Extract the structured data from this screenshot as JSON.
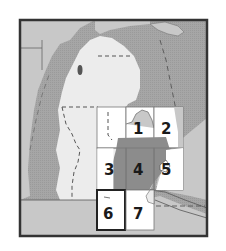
{
  "map": {
    "subject": "Michigan Lower Peninsula index map",
    "colors": {
      "water": "#a6a6a6",
      "land_outside": "#c8c8c8",
      "land_state": "#ececec",
      "highlight_region": "#8c8c8c",
      "tile_fill": "#ffffff",
      "frame": "#333333",
      "grid_line": "#777777",
      "boundary_dash": "#555555"
    },
    "tiles": [
      {
        "id": "1",
        "label": "1",
        "col": 1,
        "row": 0,
        "selected": false
      },
      {
        "id": "2",
        "label": "2",
        "col": 2,
        "row": 0,
        "selected": false
      },
      {
        "id": "3",
        "label": "3",
        "col": 0,
        "row": 1,
        "selected": false
      },
      {
        "id": "4",
        "label": "4",
        "col": 1,
        "row": 1,
        "selected": false
      },
      {
        "id": "5",
        "label": "5",
        "col": 2,
        "row": 1,
        "selected": false
      },
      {
        "id": "6",
        "label": "6",
        "col": 0,
        "row": 2,
        "selected": true
      },
      {
        "id": "7",
        "label": "7",
        "col": 1,
        "row": 2,
        "selected": false
      }
    ]
  }
}
